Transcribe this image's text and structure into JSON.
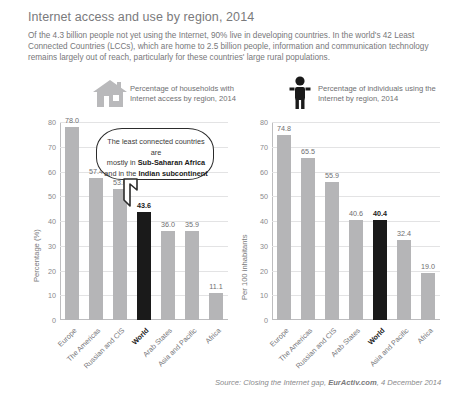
{
  "header": {
    "title": "Internet access and use by region, 2014",
    "intro": "Of the 4.3 billion people not yet using the Internet, 90% live in developing countries. In the world's 42 Least Connected Countries (LCCs), which are home to 2.5 billion people, information and communication technology remains largely out of reach, particularly for these countries' large rural populations."
  },
  "panels": {
    "left": {
      "heading": "Percentage of households with Internet access by region, 2014",
      "icon": "house-icon"
    },
    "right": {
      "heading": "Percentage of individuals using the Internet by region, 2014",
      "icon": "person-icon"
    }
  },
  "callout": {
    "line1": "The least connected countries are",
    "line2_prefix": "mostly in ",
    "line2_bold": "Sub-Saharan Africa",
    "line3_prefix": "and in the ",
    "line3_bold": "Indian subcontinent"
  },
  "source": {
    "prefix": "Source: Closing the Internet gap, ",
    "publisher": "EurActiv.com",
    "suffix": ", 4 December 2014"
  },
  "chart_data": [
    {
      "type": "bar",
      "title": "Percentage of households with Internet access by region, 2014",
      "xlabel": "",
      "ylabel": "Percentage (%)",
      "ylim": [
        0,
        80
      ],
      "yticks": [
        0,
        10,
        20,
        30,
        40,
        50,
        60,
        70,
        80
      ],
      "grid": true,
      "legend": "none",
      "categories": [
        "Europe",
        "The Americas",
        "Russian and CIS",
        "World",
        "Arab States",
        "Asia and Pacific",
        "Africa"
      ],
      "values": [
        78.0,
        57.4,
        53.0,
        43.6,
        36.0,
        35.9,
        11.1
      ],
      "labels": [
        "78.0",
        "57.4",
        "53.0",
        "43.6",
        "36.0",
        "35.9",
        "11.1"
      ],
      "highlight_index": 3,
      "colors": {
        "bar": "#b5b5b7",
        "highlight": "#1a1a1a"
      }
    },
    {
      "type": "bar",
      "title": "Percentage of individuals using the Internet by region, 2014",
      "xlabel": "",
      "ylabel": "Per 100 inhabitants",
      "ylim": [
        0,
        80
      ],
      "yticks": [
        0,
        10,
        20,
        30,
        40,
        50,
        60,
        70,
        80
      ],
      "grid": true,
      "legend": "none",
      "categories": [
        "Europe",
        "The Americas",
        "Russian and CIS",
        "Arab States",
        "World",
        "Asia and Pacific",
        "Africa"
      ],
      "values": [
        74.8,
        65.5,
        55.9,
        40.6,
        40.4,
        32.4,
        19.0
      ],
      "labels": [
        "74.8",
        "65.5",
        "55.9",
        "40.6",
        "40.4",
        "32.4",
        "19.0"
      ],
      "highlight_index": 4,
      "colors": {
        "bar": "#b5b5b7",
        "highlight": "#1a1a1a"
      }
    }
  ]
}
